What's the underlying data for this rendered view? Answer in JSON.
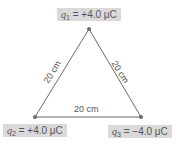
{
  "charges": [
    {
      "symbol": "q",
      "subscript": "1",
      "value": "= +4.0 μC",
      "position": "top"
    },
    {
      "symbol": "q",
      "subscript": "2",
      "value": "= +4.0 μC",
      "position": "bottom-left"
    },
    {
      "symbol": "q",
      "subscript": "3",
      "value": "= −4.0 μC",
      "position": "bottom-right"
    }
  ],
  "sides": {
    "left": "20 cm",
    "right": "20 cm",
    "bottom": "20 cm"
  },
  "colors": {
    "line": "#6a6a6a",
    "point": "#6a6a6a",
    "label_bg": "#d9d9d9",
    "text": "#555555"
  }
}
